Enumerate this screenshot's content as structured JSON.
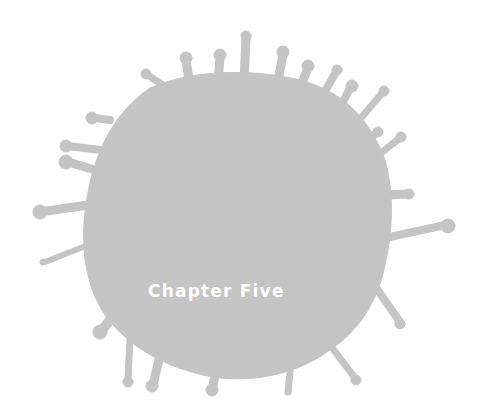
{
  "page": {
    "type": "chapter-opener",
    "chapter_title": "Chapter Five",
    "colors": {
      "background": "#ffffff",
      "splat": "#c4c4c4",
      "title_text": "#ffffff"
    },
    "decoration_icon": "ink-splat-icon"
  }
}
